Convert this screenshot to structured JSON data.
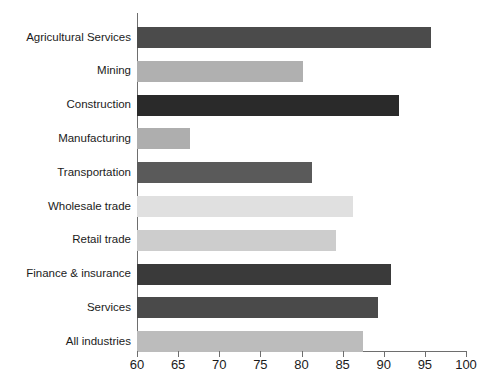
{
  "chart_data": {
    "type": "bar",
    "orientation": "horizontal",
    "title": "",
    "subtitle": "",
    "xlabel": "",
    "ylabel": "",
    "xlim": [
      60,
      100
    ],
    "xticks": [
      60,
      65,
      70,
      75,
      80,
      85,
      90,
      95,
      100
    ],
    "xtick_labels": [
      "60",
      "65",
      "70",
      "75",
      "80",
      "85",
      "90",
      "95",
      "100"
    ],
    "grid": false,
    "legend": false,
    "legend_position": "none",
    "categories": [
      "Agricultural Services",
      "Mining",
      "Construction",
      "Manufacturing",
      "Transportation",
      "Wholesale trade",
      "Retail trade",
      "Finance & insurance",
      "Services",
      "All industries"
    ],
    "values": [
      95.7,
      80.2,
      91.9,
      66.4,
      81.3,
      86.3,
      84.2,
      90.9,
      89.3,
      87.5
    ],
    "bar_colors": [
      "#4b4b4b",
      "#b0b0b0",
      "#2a2a2a",
      "#aeaeae",
      "#5a5a5a",
      "#e0e0e0",
      "#cdcdcd",
      "#3a3a3a",
      "#4a4a4a",
      "#bcbcbc"
    ],
    "axis_color": "#6e6e6e",
    "text_color": "#1b1b1b",
    "background_color": "#ffffff"
  }
}
